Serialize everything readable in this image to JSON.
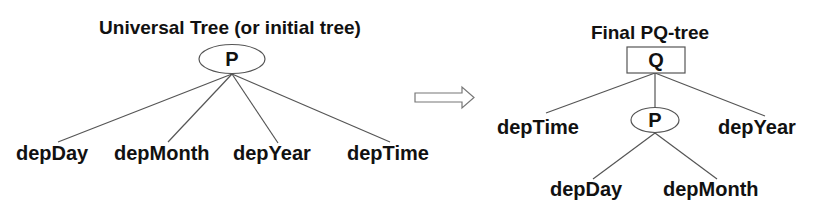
{
  "diagram": {
    "left_tree": {
      "title": "Universal Tree (or initial tree)",
      "root": {
        "type": "P",
        "label": "P",
        "shape": "ellipse"
      },
      "leaves": [
        {
          "label": "depDay"
        },
        {
          "label": "depMonth"
        },
        {
          "label": "depYear"
        },
        {
          "label": "depTime"
        }
      ]
    },
    "transition_arrow": {
      "icon": "hollow-right-arrow-icon"
    },
    "right_tree": {
      "title": "Final PQ-tree",
      "root": {
        "type": "Q",
        "label": "Q",
        "shape": "rectangle"
      },
      "root_children": [
        {
          "label": "depTime",
          "kind": "leaf"
        },
        {
          "label": "P",
          "kind": "P-node",
          "shape": "ellipse"
        },
        {
          "label": "depYear",
          "kind": "leaf"
        }
      ],
      "p_node_children": [
        {
          "label": "depDay"
        },
        {
          "label": "depMonth"
        }
      ]
    },
    "colors": {
      "text": "#111111",
      "lines": "#555555",
      "background": "#ffffff"
    }
  }
}
